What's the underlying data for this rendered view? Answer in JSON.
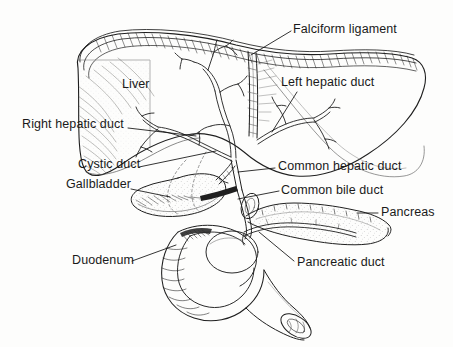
{
  "figure": {
    "style": "pen-and-ink line engraving with hatching and stippling",
    "background_color": "#fdfdfc",
    "ink_color": "#1a1a1a",
    "width": 453,
    "height": 347
  },
  "labels": {
    "falciform_ligament": "Falciform ligament",
    "liver": "Liver",
    "left_hepatic_duct": "Left hepatic duct",
    "right_hepatic_duct": "Right hepatic duct",
    "cystic_duct": "Cystic duct",
    "common_hepatic_duct": "Common hepatic duct",
    "gallbladder": "Gallbladder",
    "common_bile_duct": "Common bile duct",
    "pancreas": "Pancreas",
    "duodenum": "Duodenum",
    "pancreatic_duct": "Pancreatic duct"
  },
  "structures": [
    {
      "name": "liver",
      "label": "Liver",
      "description": "large hatched organ occupying upper portion, right lobe at left with diagonal shading, thin left lobe extending to upper right"
    },
    {
      "name": "falciform-ligament",
      "label": "Falciform ligament",
      "description": "vertical fissure band between liver lobes"
    },
    {
      "name": "biliary-tree",
      "label": "intrahepatic bile ducts",
      "description": "branching duct tree inside liver converging to hilum"
    },
    {
      "name": "right-hepatic-duct",
      "label": "Right hepatic duct",
      "description": "duct from right lobe to hilum junction"
    },
    {
      "name": "left-hepatic-duct",
      "label": "Left hepatic duct",
      "description": "duct from left lobe to hilum junction"
    },
    {
      "name": "common-hepatic-duct",
      "label": "Common hepatic duct",
      "description": "duct descending from hilum junction"
    },
    {
      "name": "gallbladder",
      "label": "Gallbladder",
      "description": "pear-shaped sac under right lobe, stippled body"
    },
    {
      "name": "cystic-duct",
      "label": "Cystic duct",
      "description": "narrow duct from gallbladder neck to common duct"
    },
    {
      "name": "common-bile-duct",
      "label": "Common bile duct",
      "description": "duct descending behind duodenum to ampulla"
    },
    {
      "name": "pancreas",
      "label": "Pancreas",
      "description": "elongated stippled gland extending right, head nested in duodenal curve"
    },
    {
      "name": "pancreatic-duct",
      "label": "Pancreatic duct",
      "description": "duct running length of pancreas joining bile duct"
    },
    {
      "name": "duodenum",
      "label": "Duodenum",
      "description": "C-shaped bowel loop with transverse mucosal folds and cut distal end"
    }
  ],
  "leader_lines": [
    {
      "for": "falciform_ligament",
      "from": [
        291,
        31
      ],
      "to": [
        251,
        55
      ]
    },
    {
      "for": "left_hepatic_duct",
      "from": [
        297,
        92
      ],
      "to": [
        272,
        132
      ]
    },
    {
      "for": "right_hepatic_duct",
      "from": [
        128,
        128
      ],
      "to": [
        196,
        136
      ]
    },
    {
      "for": "cystic_duct",
      "from": [
        139,
        167
      ],
      "to": [
        216,
        151
      ]
    },
    {
      "for": "common_hepatic_duct",
      "from": [
        275,
        168
      ],
      "to": [
        238,
        172
      ]
    },
    {
      "for": "gallbladder",
      "from": [
        131,
        189
      ],
      "to": [
        170,
        197
      ]
    },
    {
      "for": "common_bile_duct",
      "from": [
        279,
        191
      ],
      "to": [
        238,
        199
      ]
    },
    {
      "for": "pancreas",
      "from": [
        378,
        213
      ],
      "to": [
        357,
        213
      ]
    },
    {
      "for": "duodenum",
      "from": [
        132,
        261
      ],
      "to": [
        176,
        245
      ]
    },
    {
      "for": "pancreatic_duct",
      "from": [
        294,
        261
      ],
      "to": [
        259,
        232
      ]
    }
  ]
}
